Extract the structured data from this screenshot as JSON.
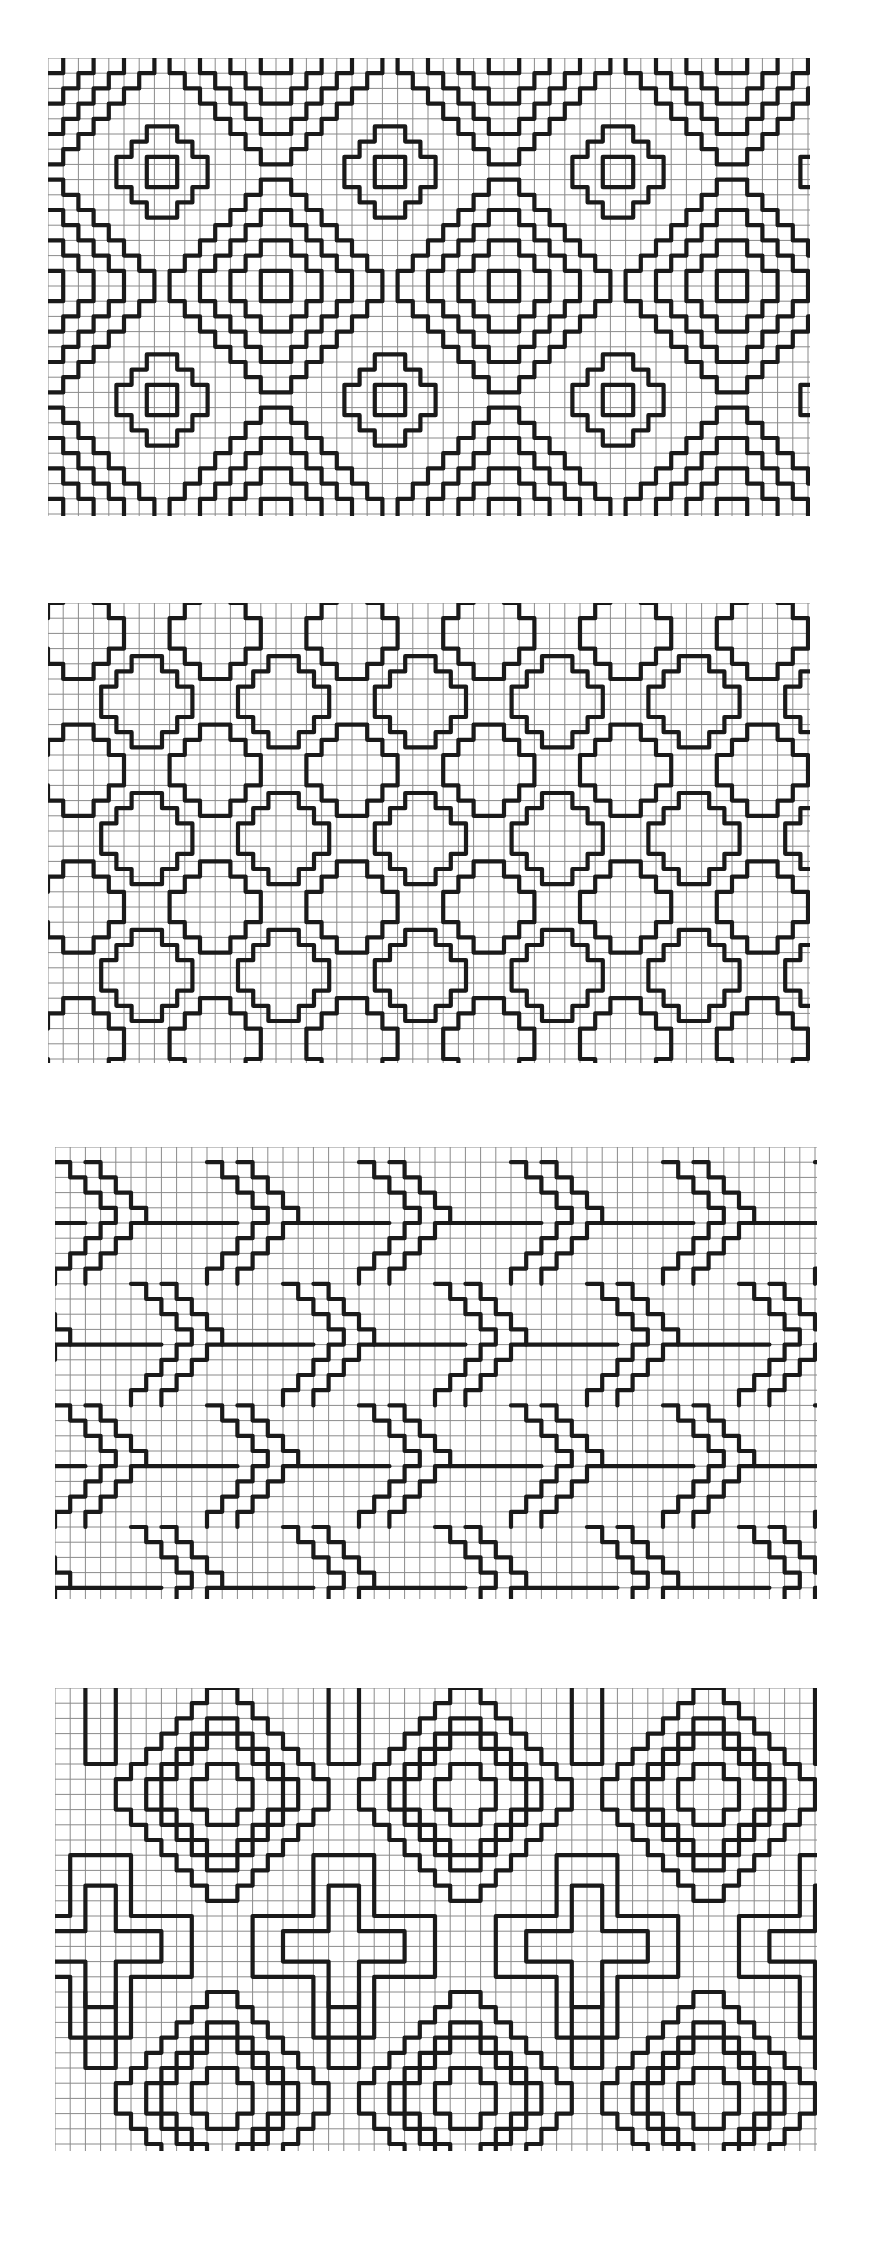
{
  "page": {
    "width": 871,
    "height": 2268,
    "background": "#ffffff"
  },
  "style": {
    "grid_color": "#8a8a8a",
    "grid_width": 1,
    "ink_color": "#1a1a1a",
    "ink_width": 4.2
  },
  "panels": [
    {
      "id": "panel-1",
      "name": "diamond-lattice-pattern",
      "x": 48,
      "y": 58,
      "w": 762,
      "h": 458,
      "cell": 15.2,
      "motif": "nested-diamonds"
    },
    {
      "id": "panel-2",
      "name": "stepped-cross-pattern",
      "x": 48,
      "y": 603,
      "w": 762,
      "h": 460,
      "cell": 15.2,
      "motif": "stepped-crosses"
    },
    {
      "id": "panel-3",
      "name": "chevron-arrow-pattern",
      "x": 55,
      "y": 1147,
      "w": 762,
      "h": 452,
      "cell": 15.2,
      "motif": "chevrons"
    },
    {
      "id": "panel-4",
      "name": "diamond-and-cross-pattern",
      "x": 55,
      "y": 1688,
      "w": 762,
      "h": 463,
      "cell": 15.2,
      "motif": "diamond-cross"
    }
  ]
}
